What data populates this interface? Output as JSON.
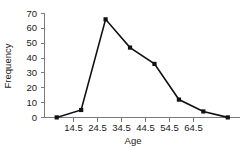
{
  "chart_data": {
    "type": "line",
    "title": "",
    "xlabel": "Age",
    "ylabel": "Frequency",
    "x": [
      4.5,
      14.5,
      24.5,
      34.5,
      44.5,
      54.5,
      64.5,
      74.5
    ],
    "values": [
      0,
      5,
      66,
      47,
      36,
      12,
      4,
      0
    ],
    "series": [
      {
        "name": "Frequency",
        "values": [
          0,
          5,
          66,
          47,
          36,
          12,
          4,
          0
        ]
      }
    ],
    "xlim": [
      -0.5,
      79.5
    ],
    "ylim": [
      0,
      70
    ],
    "x_tick_labels": [
      "14.5",
      "24.5",
      "34.5",
      "44.5",
      "54.5",
      "64.5"
    ],
    "x_tick_values": [
      14.5,
      24.5,
      34.5,
      44.5,
      54.5,
      64.5
    ],
    "y_tick_labels": [
      "0",
      "10",
      "20",
      "30",
      "40",
      "50",
      "60",
      "70"
    ],
    "y_tick_values": [
      0,
      10,
      20,
      30,
      40,
      50,
      60,
      70
    ],
    "grid": false,
    "legend": "none",
    "marker": "square",
    "line_color": "#111111",
    "marker_color": "#111111",
    "axis_color": "#7a7a7a",
    "background_color": "#ffffff"
  }
}
